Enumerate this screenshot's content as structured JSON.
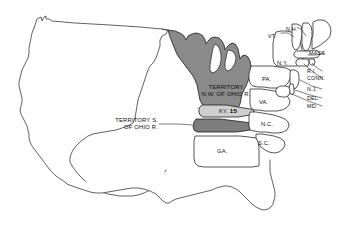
{
  "map": {
    "title": "United States 1792",
    "background_color": "#ffffff",
    "outline_color": "#333333",
    "territory_nw_fill": "#8a8a8a",
    "territory_s_fill": "#7d7d7d",
    "kentucky_fill": "#cfcfcf",
    "state_fill": "#ffffff",
    "lake_fill": "#ffffff"
  },
  "territories": [
    {
      "id": "territory-nw-ohio",
      "line1": "TERRITORY",
      "line2": "N.W. OF OHIO R.",
      "fill": "#8a8a8a"
    },
    {
      "id": "territory-s-ohio",
      "line1": "TERRITORY S.",
      "line2": "OF OHIO R.",
      "fill": "#7d7d7d"
    }
  ],
  "states": [
    {
      "id": "kentucky",
      "label": "KY.",
      "number": "15"
    },
    {
      "id": "vermont",
      "label": "VT."
    },
    {
      "id": "new-hampshire",
      "label": "N.H."
    },
    {
      "id": "massachusetts",
      "label": "MASS."
    },
    {
      "id": "new-york",
      "label": "N.Y."
    },
    {
      "id": "rhode-island",
      "label": "R.I."
    },
    {
      "id": "connecticut",
      "label": "CONN."
    },
    {
      "id": "pennsylvania",
      "label": "PA."
    },
    {
      "id": "new-jersey",
      "label": "N.J."
    },
    {
      "id": "delaware",
      "label": "DEL."
    },
    {
      "id": "maryland",
      "label": "MD."
    },
    {
      "id": "virginia",
      "label": "VA."
    },
    {
      "id": "north-carolina",
      "label": "N.C."
    },
    {
      "id": "south-carolina",
      "label": "S.C."
    },
    {
      "id": "georgia",
      "label": "GA."
    }
  ]
}
